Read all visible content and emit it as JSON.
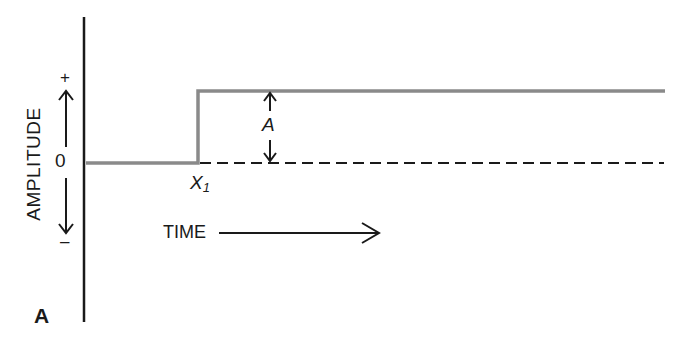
{
  "diagram": {
    "type": "step-function",
    "y_axis": {
      "label": "AMPLITUDE",
      "zero_label": "0",
      "positive_label": "+",
      "negative_label": "–"
    },
    "x_axis": {
      "label": "TIME"
    },
    "step_point_label": "X",
    "step_point_subscript": "1",
    "amplitude_label": "A",
    "panel_label": "A",
    "colors": {
      "signal": "#8a8a8a",
      "axis": "#1a1a1a",
      "baseline_dashed": "#1a1a1a",
      "background": "#ffffff"
    }
  }
}
